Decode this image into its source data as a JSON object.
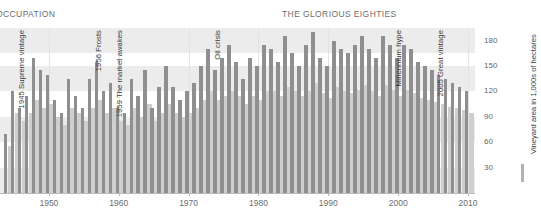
{
  "header": {
    "left_label": "OCCUPATION",
    "center_title": "THE GLORIOUS EIGHTIES"
  },
  "legend": {
    "series_label": "Vineyard area in 1,000s of hectares",
    "swatch_color": "#b2b2b2"
  },
  "colors": {
    "bar_dark": "#8f8f8f",
    "bar_light": "#cfcfcf",
    "band": "#ececec",
    "gridline": "#e3e3e3",
    "axis": "#b9b9b9",
    "text": "#6d6d6d"
  },
  "annotations": [
    {
      "text": "1945 Supreme vintage",
      "year": 1945
    },
    {
      "text": "1956 Frosts",
      "year": 1956
    },
    {
      "text": "1959 The market awakes",
      "year": 1959
    },
    {
      "text": "Oil crisis",
      "year": 1973
    },
    {
      "text": "Millennium hype",
      "year": 1999
    },
    {
      "text": "2005 Great vintage",
      "year": 2005
    }
  ],
  "chart_data": {
    "type": "bar",
    "title": "THE GLORIOUS EIGHTIES",
    "xlabel": "",
    "ylabel": "Vineyard area in 1,000s of hectares",
    "xlim": [
      1943,
      2011
    ],
    "ylim": [
      0,
      195
    ],
    "yticks": [
      30,
      60,
      90,
      120,
      150,
      180
    ],
    "xticks": [
      1950,
      1960,
      1970,
      1980,
      1990,
      2000,
      2010
    ],
    "xtick_labels": [
      "1950",
      "1960",
      "1970",
      "1980",
      "1990",
      "2000",
      "2010"
    ],
    "grid": "horizontal-bands",
    "legend_position": "right",
    "series": [
      {
        "name": "Vineyard area in 1,000s of hectares",
        "color": "#8f8f8f",
        "values": [
          70,
          120,
          100,
          115,
          160,
          145,
          140,
          110,
          95,
          135,
          115,
          100,
          135,
          155,
          120,
          130,
          100,
          95,
          135,
          115,
          145,
          100,
          125,
          150,
          125,
          110,
          120,
          130,
          150,
          170,
          145,
          160,
          175,
          155,
          135,
          160,
          150,
          175,
          170,
          155,
          185,
          165,
          150,
          175,
          190,
          160,
          150,
          180,
          170,
          165,
          175,
          185,
          170,
          160,
          185,
          175,
          160,
          175,
          170,
          155,
          150,
          145,
          140,
          135,
          130,
          125,
          120
        ]
      },
      {
        "name": "secondary",
        "color": "#cfcfcf",
        "values": [
          55,
          95,
          85,
          95,
          110,
          100,
          105,
          90,
          80,
          100,
          95,
          85,
          100,
          110,
          95,
          100,
          85,
          80,
          100,
          90,
          105,
          85,
          95,
          105,
          95,
          90,
          95,
          100,
          110,
          120,
          110,
          115,
          120,
          115,
          105,
          115,
          110,
          120,
          120,
          115,
          125,
          120,
          115,
          120,
          130,
          118,
          112,
          125,
          120,
          118,
          122,
          128,
          120,
          115,
          128,
          122,
          115,
          122,
          118,
          112,
          110,
          108,
          105,
          102,
          100,
          98,
          95
        ]
      }
    ],
    "x": [
      1944,
      1945,
      1946,
      1947,
      1948,
      1949,
      1950,
      1951,
      1952,
      1953,
      1954,
      1955,
      1956,
      1957,
      1958,
      1959,
      1960,
      1961,
      1962,
      1963,
      1964,
      1965,
      1966,
      1967,
      1968,
      1969,
      1970,
      1971,
      1972,
      1973,
      1974,
      1975,
      1976,
      1977,
      1978,
      1979,
      1980,
      1981,
      1982,
      1983,
      1984,
      1985,
      1986,
      1987,
      1988,
      1989,
      1990,
      1991,
      1992,
      1993,
      1994,
      1995,
      1996,
      1997,
      1998,
      1999,
      2000,
      2001,
      2002,
      2003,
      2004,
      2005,
      2006,
      2007,
      2008,
      2009,
      2010
    ]
  }
}
